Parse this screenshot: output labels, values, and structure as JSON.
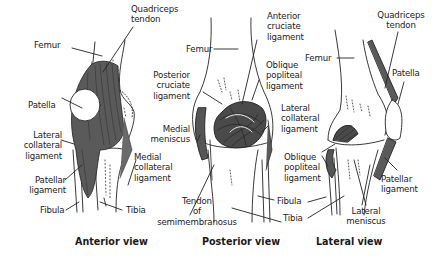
{
  "figure": {
    "colors": {
      "ligament": "#555555",
      "ligament_dark": "#3a3a3a",
      "bone_outline": "#222222",
      "patella": "#ffffff",
      "background": "#ffffff"
    },
    "views": [
      {
        "caption": "Anterior view",
        "labels": {
          "femur": "Femur",
          "quadriceps_tendon": "Quadriceps\ntendon",
          "patella": "Patella",
          "lateral_collateral": "Lateral\ncollateral\nligament",
          "patellar_ligament": "Patellar\nligament",
          "fibula": "Fibula",
          "medial_collateral": "Medial\ncollateral\nligament",
          "tibia": "Tibia"
        }
      },
      {
        "caption": "Posterior view",
        "labels": {
          "femur": "Femur",
          "posterior_cruciate": "Posterior\ncruciate\nligament",
          "medial_meniscus": "Medial\nmeniscus",
          "tendon_semimembranosus": "Tendon\nof\nsemimembranosus",
          "anterior_cruciate": "Anterior\ncruciate\nligament",
          "oblique_popliteal": "Oblique\npopliteal\nligament",
          "lateral_collateral": "Lateral\ncollateral\nligament",
          "fibula": "Fibula",
          "tibia": "Tibia"
        }
      },
      {
        "caption": "Lateral view",
        "labels": {
          "femur": "Femur",
          "quadriceps_tendon": "Quadriceps\ntendon",
          "patella": "Patella",
          "oblique_popliteal": "Oblique\npopliteal\nligament",
          "patellar_ligament": "Patellar\nligament",
          "lateral_meniscus": "Lateral\nmeniscus"
        }
      }
    ]
  }
}
